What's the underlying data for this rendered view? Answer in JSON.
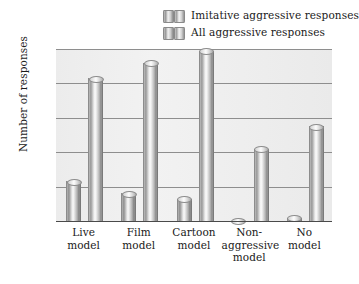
{
  "legend": {
    "items": [
      {
        "label": "Imitative aggressive responses",
        "swatch": "cylinder-pair-icon"
      },
      {
        "label": "All aggressive responses",
        "swatch": "cylinder-pair-icon"
      }
    ]
  },
  "axes": {
    "ylabel": "Number of responses",
    "yticks": [
      "100",
      "80",
      "60",
      "40",
      "20"
    ]
  },
  "chart_data": {
    "type": "bar",
    "title": "",
    "xlabel": "",
    "ylabel": "Number of responses",
    "ylim": [
      0,
      100
    ],
    "yticks": [
      0,
      20,
      40,
      60,
      80,
      100
    ],
    "grid": true,
    "legend_position": "top-right",
    "categories": [
      "Live model",
      "Film model",
      "Cartoon model",
      "Non-aggressive model",
      "No model"
    ],
    "category_lines": [
      [
        "Live",
        "model"
      ],
      [
        "Film",
        "model"
      ],
      [
        "Cartoon",
        "model"
      ],
      [
        "Non-",
        "aggressive",
        "model"
      ],
      [
        "No",
        "model"
      ]
    ],
    "series": [
      {
        "name": "Imitative aggressive responses",
        "values": [
          23,
          16,
          13,
          0,
          2
        ]
      },
      {
        "name": "All aggressive responses",
        "values": [
          83,
          92,
          99,
          42,
          55
        ]
      }
    ]
  }
}
